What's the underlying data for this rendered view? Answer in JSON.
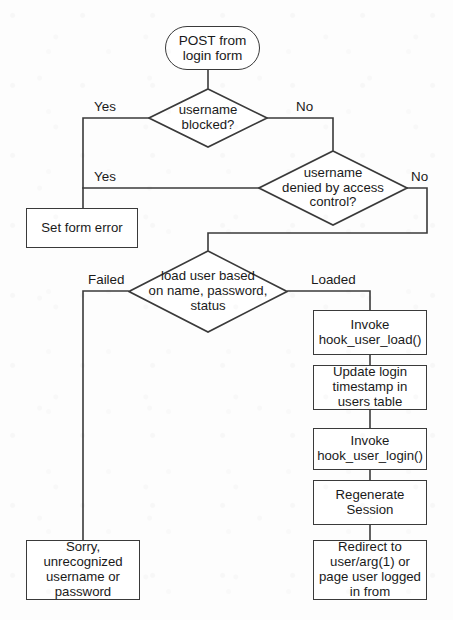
{
  "diagram": {
    "type": "flowchart",
    "canvas": {
      "width": 453,
      "height": 620
    },
    "colors": {
      "stroke": "#3a3a3a",
      "text": "#1a1a1a",
      "background": "#fdfdfd",
      "node_fill": "#ffffff"
    },
    "nodes": {
      "start": {
        "shape": "terminator",
        "lines": [
          "POST from",
          "login form"
        ]
      },
      "decision_blocked": {
        "shape": "diamond",
        "lines": [
          "username",
          "blocked?"
        ]
      },
      "decision_access": {
        "shape": "diamond",
        "lines": [
          "username",
          "denied by access",
          "control?"
        ]
      },
      "decision_load": {
        "shape": "diamond",
        "lines": [
          "load user based",
          "on name, password,",
          "status"
        ]
      },
      "set_form_error": {
        "shape": "process",
        "lines": [
          "Set form error"
        ]
      },
      "hook_user_load": {
        "shape": "process",
        "lines": [
          "Invoke",
          "hook_user_load()"
        ]
      },
      "update_login_timestamp": {
        "shape": "process",
        "lines": [
          "Update login",
          "timestamp in",
          "users table"
        ]
      },
      "hook_user_login": {
        "shape": "process",
        "lines": [
          "Invoke",
          "hook_user_login()"
        ]
      },
      "regenerate_session": {
        "shape": "process",
        "lines": [
          "Regenerate",
          "Session"
        ]
      },
      "redirect": {
        "shape": "process",
        "lines": [
          "Redirect to",
          "user/arg(1) or",
          "page user logged",
          "in from"
        ]
      },
      "error_message": {
        "shape": "process",
        "lines": [
          "Sorry,",
          "unrecognized",
          "username or",
          "password"
        ]
      }
    },
    "edge_labels": {
      "blocked_yes": "Yes",
      "blocked_no": "No",
      "access_yes": "Yes",
      "access_no": "No",
      "load_failed": "Failed",
      "load_loaded": "Loaded"
    }
  }
}
